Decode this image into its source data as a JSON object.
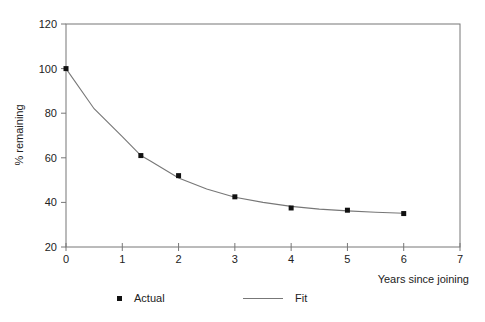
{
  "chart_data": {
    "type": "scatter",
    "title": "",
    "xlabel": "Years since joining",
    "ylabel": "% remaining",
    "xlim": [
      0,
      7
    ],
    "ylim": [
      20,
      120
    ],
    "x_ticks": [
      0,
      1,
      2,
      3,
      4,
      5,
      6,
      7
    ],
    "y_ticks": [
      20,
      40,
      60,
      80,
      100,
      120
    ],
    "grid": false,
    "legend_position": "bottom",
    "series": [
      {
        "name": "Actual",
        "type": "scatter",
        "marker": "square",
        "color": "#111111",
        "x": [
          0,
          1.33,
          2,
          3,
          4,
          5,
          6
        ],
        "y": [
          100,
          61,
          52,
          42.5,
          37.5,
          36.5,
          35
        ]
      },
      {
        "name": "Fit",
        "type": "line",
        "color": "#777777",
        "x": [
          0,
          0.5,
          1,
          1.33,
          1.5,
          2,
          2.5,
          3,
          3.5,
          4,
          4.5,
          5,
          5.5,
          6
        ],
        "y": [
          100,
          82,
          69.5,
          61,
          58.5,
          51,
          46,
          42.3,
          40,
          38.2,
          37,
          36.2,
          35.6,
          35.1
        ]
      }
    ]
  },
  "legend": {
    "actual_label": "Actual",
    "fit_label": "Fit"
  },
  "axes": {
    "xlabel": "Years since joining",
    "ylabel": "% remaining",
    "x_tick_labels": [
      "0",
      "1",
      "2",
      "3",
      "4",
      "5",
      "6",
      "7"
    ],
    "y_tick_labels": [
      "20",
      "40",
      "60",
      "80",
      "100",
      "120"
    ]
  }
}
